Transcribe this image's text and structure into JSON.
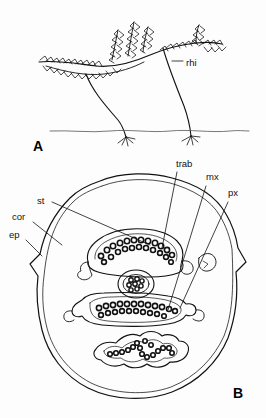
{
  "figure": {
    "background_color": "#fdfdfd",
    "ink_color": "#111111",
    "type": "botanical-line-drawing",
    "panels": [
      {
        "letter": "A",
        "name": "habit-sketch",
        "description": "Creeping rhizomatous plant with leafy shoots above a ground line and descending roots",
        "labels": [
          {
            "key": "rhi",
            "text": "rhi",
            "meaning": "rhizome",
            "x": 186,
            "y": 66
          }
        ]
      },
      {
        "letter": "B",
        "name": "stem-cross-section",
        "description": "Transverse section of stem showing epidermis, cortex and three arcuate vascular bundles with a central circular strand",
        "labels": [
          {
            "key": "trab",
            "text": "trab",
            "meaning": "trabecula",
            "x": 176,
            "y": 167
          },
          {
            "key": "mx",
            "text": "mx",
            "meaning": "metaxylem",
            "x": 206,
            "y": 180
          },
          {
            "key": "px",
            "text": "px",
            "meaning": "protoxylem",
            "x": 228,
            "y": 196
          },
          {
            "key": "st",
            "text": "st",
            "meaning": "stele",
            "x": 37,
            "y": 204
          },
          {
            "key": "cor",
            "text": "cor",
            "meaning": "cortex",
            "x": 12,
            "y": 220
          },
          {
            "key": "ep",
            "text": "ep",
            "meaning": "epidermis",
            "x": 9,
            "y": 238
          }
        ]
      }
    ],
    "panel_letters": [
      {
        "text": "A",
        "x": 33,
        "y": 151
      },
      {
        "text": "B",
        "x": 233,
        "y": 398
      }
    ]
  }
}
